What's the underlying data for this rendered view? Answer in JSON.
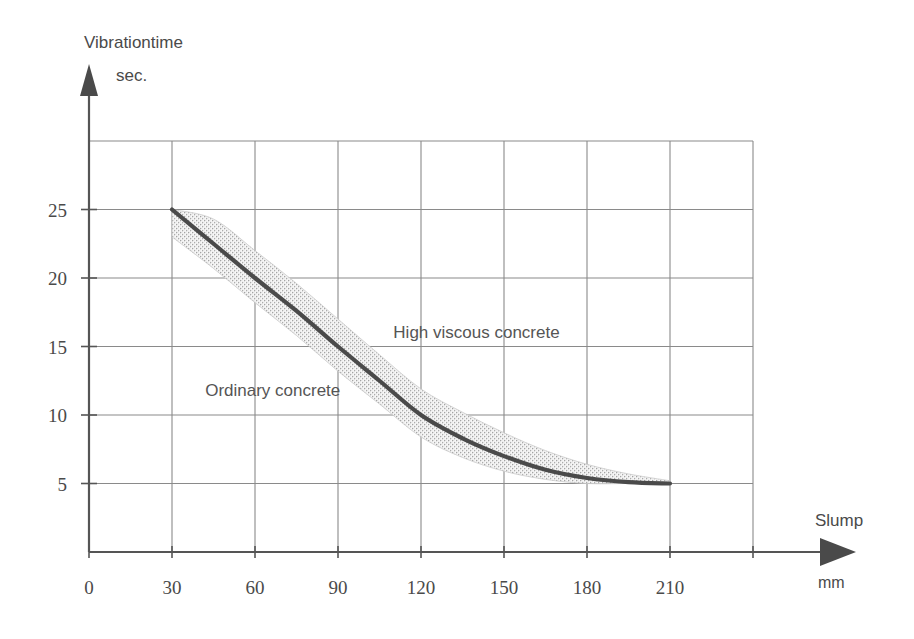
{
  "chart_data": {
    "type": "line",
    "title": "",
    "subtitle": "",
    "xlabel": "Slump",
    "xunit": "mm",
    "ylabel": "Vibrationtime",
    "yunit": "sec.",
    "xlim": [
      0,
      240
    ],
    "ylim": [
      0,
      30
    ],
    "grid": true,
    "legend_position": "inline-annotations",
    "xticks": [
      0,
      30,
      60,
      90,
      120,
      150,
      180,
      210
    ],
    "xtick_labels": [
      "0",
      "30",
      "60",
      "90",
      "120",
      "150",
      "180",
      "210"
    ],
    "yticks": [
      5,
      10,
      15,
      20,
      25
    ],
    "ytick_labels": [
      "5",
      "10",
      "15",
      "20",
      "25"
    ],
    "x_gridlines": [
      0,
      30,
      60,
      90,
      120,
      150,
      180,
      210,
      240
    ],
    "y_gridlines": [
      0,
      5,
      10,
      15,
      20,
      25,
      30
    ],
    "series": [
      {
        "name": "Vibration time vs slump",
        "x": [
          30,
          45,
          60,
          75,
          90,
          105,
          120,
          135,
          150,
          165,
          180,
          195,
          210
        ],
        "values": [
          25.0,
          22.5,
          20.0,
          17.6,
          15.0,
          12.5,
          10.0,
          8.3,
          7.0,
          6.0,
          5.4,
          5.1,
          5.0
        ]
      }
    ],
    "band": {
      "name": "scatter band",
      "x": [
        30,
        45,
        60,
        75,
        90,
        105,
        120,
        135,
        150,
        165,
        180,
        195,
        210
      ],
      "upper": [
        25.0,
        24.3,
        22.0,
        19.6,
        17.0,
        14.4,
        11.9,
        10.2,
        8.7,
        7.4,
        6.4,
        5.7,
        5.2
      ],
      "lower": [
        23.0,
        20.7,
        18.2,
        15.8,
        13.2,
        10.8,
        8.4,
        6.9,
        5.9,
        5.3,
        5.0,
        5.0,
        5.0
      ]
    },
    "annotations": [
      {
        "text": "Ordinary concrete",
        "x": 42,
        "y": 11.4
      },
      {
        "text": "High viscous concrete",
        "x": 110,
        "y": 15.6
      }
    ]
  },
  "axes": {
    "y_title_line1": "Vibrationtime",
    "y_title_line2": "sec.",
    "x_title": "Slump",
    "x_unit": "mm"
  },
  "colors": {
    "curve": "#4a4a4a",
    "grid": "#8a8a8a",
    "axis": "#555555",
    "band": "#b9b9b9",
    "text": "#4a4a4a",
    "background": "#ffffff"
  }
}
